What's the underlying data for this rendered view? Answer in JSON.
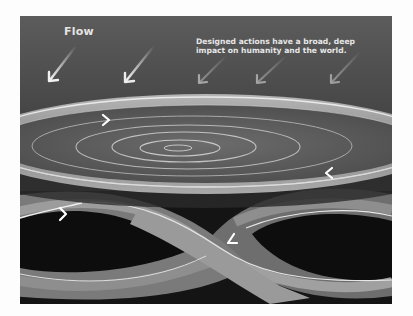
{
  "figure": {
    "flow_label": "Flow",
    "caption_line1": "Designed actions have a broad, deep",
    "caption_line2": "impact on humanity and the world.",
    "elements": {
      "incoming_arrows": 5,
      "disc": "rippling disc with concentric ellipses",
      "disc_rim_arrows": [
        "arrow-right",
        "arrow-left"
      ],
      "infinity_loop": "figure-eight band with flow arrows",
      "infinity_arrows": [
        "arrow-right",
        "arrow-down-left"
      ]
    },
    "colors": {
      "sky_top": "#5a5a5a",
      "sky_bottom": "#3a3a3a",
      "disc_rim": "#9a9a9a",
      "disc_surface": "#5e5e5e",
      "ripple": "#bdbdbd",
      "band": "#8a8a8a",
      "band_shadow": "#6a6a6a",
      "void": "#0e0e0e",
      "highlight": "#f2f2f2"
    }
  }
}
